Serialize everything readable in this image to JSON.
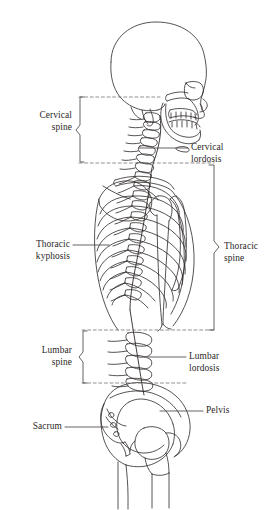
{
  "figure": {
    "view": "lateral (side) view",
    "stroke_color": "#2b2726",
    "background_color": "#ffffff",
    "dashed_color": "#6f6b6a"
  },
  "labels": {
    "cervical_spine": {
      "line1": "Cervical",
      "line2": "spine"
    },
    "cervical_lordosis": {
      "line1": "Cervical",
      "line2": "lordosis"
    },
    "thoracic_kyphosis": {
      "line1": "Thoracic",
      "line2": "kyphosis"
    },
    "thoracic_spine": {
      "line1": "Thoracic",
      "line2": "spine"
    },
    "lumbar_spine": {
      "line1": "Lumbar",
      "line2": "spine"
    },
    "lumbar_lordosis": {
      "line1": "Lumbar",
      "line2": "lordosis"
    },
    "sacrum": {
      "line1": "Sacrum"
    },
    "pelvis": {
      "line1": "Pelvis"
    }
  },
  "regions": [
    {
      "name": "cervical-spine",
      "brace_side": "left",
      "top": 97,
      "bottom": 162
    },
    {
      "name": "thoracic-spine",
      "brace_side": "right",
      "top": 165,
      "bottom": 330
    },
    {
      "name": "lumbar-spine",
      "brace_side": "left",
      "top": 331,
      "bottom": 383
    }
  ],
  "divider_lines": [
    {
      "name": "skull-base-line",
      "y": 97,
      "x1": 79,
      "x2": 160
    },
    {
      "name": "cervicothoracic-junction-line",
      "y": 163,
      "x1": 79,
      "x2": 214
    },
    {
      "name": "thoracolumbar-junction-line",
      "y": 330,
      "x1": 82,
      "x2": 214
    },
    {
      "name": "lumbosacral-junction-line",
      "y": 383,
      "x1": 82,
      "x2": 188
    }
  ],
  "anatomy_parts": [
    "skull-cranium",
    "maxilla",
    "mandible",
    "teeth",
    "orbit",
    "zygomatic-arch",
    "cervical-vertebrae",
    "thoracic-vertebrae",
    "lumbar-vertebrae",
    "rib-cage",
    "sternum",
    "scapula",
    "clavicle",
    "humerus",
    "pelvis-ilium",
    "sacrum",
    "coccyx",
    "femur-head",
    "femur"
  ]
}
